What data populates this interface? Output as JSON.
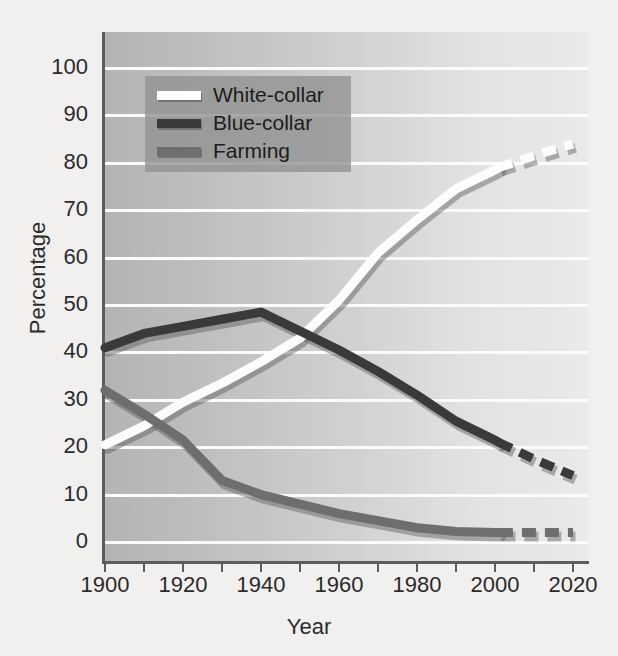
{
  "chart_data": {
    "type": "line",
    "title": "",
    "xlabel": "Year",
    "ylabel": "Percentage",
    "xlim": [
      1900,
      2020
    ],
    "ylim": [
      0,
      100
    ],
    "grid": true,
    "legend_position": "upper-left",
    "xticks": [
      "1900",
      "1920",
      "1940",
      "1960",
      "1980",
      "2000",
      "2020"
    ],
    "xtick_values": [
      1900,
      1920,
      1940,
      1960,
      1980,
      2000,
      2020
    ],
    "xminor_ticks": [
      1910,
      1930,
      1950,
      1970,
      1990,
      2010
    ],
    "yticks": [
      "0",
      "10",
      "20",
      "30",
      "40",
      "50",
      "60",
      "70",
      "80",
      "90",
      "100"
    ],
    "ytick_values": [
      0,
      10,
      20,
      30,
      40,
      50,
      60,
      70,
      80,
      90,
      100
    ],
    "note": "Solid segments are historical data; dashed segments after 2001 are projections.",
    "projection_start_year": 2001,
    "x": [
      1900,
      1910,
      1920,
      1930,
      1940,
      1950,
      1960,
      1970,
      1980,
      1990,
      2000,
      2001,
      2010,
      2020
    ],
    "series": [
      {
        "name": "White-collar",
        "color": "#fdfdfd",
        "values": [
          20.5,
          24.5,
          29.5,
          33.5,
          38.0,
          43.0,
          51.0,
          61.0,
          68.0,
          74.5,
          78.5,
          79.0,
          81.5,
          84.0
        ]
      },
      {
        "name": "Blue-collar",
        "color": "#3a3a3a",
        "values": [
          41.0,
          44.0,
          45.5,
          47.0,
          48.5,
          44.5,
          40.5,
          36.0,
          31.0,
          25.5,
          21.5,
          21.0,
          17.5,
          14.0
        ]
      },
      {
        "name": "Farming",
        "color": "#6e6e6e",
        "values": [
          32.0,
          27.0,
          21.5,
          13.0,
          10.0,
          8.0,
          6.0,
          4.5,
          3.0,
          2.2,
          2.0,
          2.0,
          2.0,
          2.0
        ]
      }
    ]
  },
  "axes": {
    "x_title": "Year",
    "y_title": "Percentage",
    "x_tick_labels": [
      "1900",
      "1920",
      "1940",
      "1960",
      "1980",
      "2000",
      "2020"
    ],
    "y_tick_labels": [
      "100",
      "90",
      "80",
      "70",
      "60",
      "50",
      "40",
      "30",
      "20",
      "10",
      "0"
    ]
  },
  "legend": {
    "items": [
      {
        "label": "White-collar",
        "color": "#fdfdfd"
      },
      {
        "label": "Blue-collar",
        "color": "#3a3a3a"
      },
      {
        "label": "Farming",
        "color": "#6e6e6e"
      }
    ]
  },
  "colors": {
    "page_background": "#f1f0ef",
    "plot_background_left": "#b4b4b4",
    "plot_background_right": "#eceae9",
    "gridline": "#fbfbfb",
    "axis": "#5d5d5d",
    "legend_background": "#919191",
    "text": "#2b2b2b"
  }
}
